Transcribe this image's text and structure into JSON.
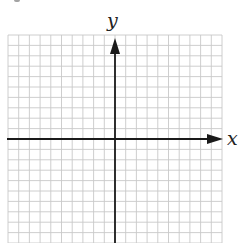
{
  "diagram": {
    "type": "coordinate-grid",
    "x_axis_label": "x",
    "y_axis_label": "y",
    "grid": {
      "columns_left_of_y_axis": 10,
      "columns_right_of_y_axis": 10,
      "rows_above_x_axis": 10,
      "rows_below_x_axis": 10,
      "grid_color": "#c8c8c8",
      "axis_color": "#1a1a1a"
    }
  }
}
